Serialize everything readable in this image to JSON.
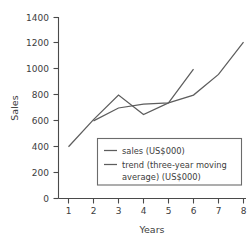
{
  "chart_data": {
    "type": "line",
    "title": "",
    "subtitle": "",
    "xlabel": "Years",
    "ylabel": "Sales",
    "x": [
      1,
      2,
      3,
      4,
      5,
      6,
      7,
      8
    ],
    "xtick_labels": [
      "1",
      "2",
      "3",
      "4",
      "5",
      "6",
      "7",
      "8"
    ],
    "ytick_labels": [
      "0",
      "200",
      "400",
      "600",
      "800",
      "1000",
      "1200",
      "1400"
    ],
    "ytick_values": [
      0,
      200,
      400,
      600,
      800,
      1000,
      1200,
      1400
    ],
    "xlim": [
      0.6,
      8.3
    ],
    "ylim": [
      0,
      1400
    ],
    "grid": false,
    "legend_position": "center-right-inside",
    "series": [
      {
        "name": "sales (US$000)",
        "x": [
          1,
          2,
          3,
          4,
          5,
          6,
          7,
          8
        ],
        "values": [
          400,
          610,
          800,
          650,
          740,
          800,
          960,
          1210
        ],
        "color": "#5d5d5d"
      },
      {
        "name": "trend (three-year moving average) (US$000)",
        "x": [
          2,
          3,
          4,
          5,
          6
        ],
        "values": [
          600,
          700,
          730,
          740,
          1000
        ],
        "color": "#5d5d5d"
      }
    ],
    "legend_entries": [
      {
        "label": "sales (US$000)",
        "lines": [
          "sales (US$000)"
        ],
        "color": "#5d5d5d"
      },
      {
        "label": "trend (three-year moving average) (US$000)",
        "lines": [
          "trend (three-year moving",
          "average) (US$000)"
        ],
        "color": "#5d5d5d"
      }
    ],
    "colors": {
      "axis": "#4a4a4a",
      "text": "#3d3d3d",
      "series": "#5d5d5d",
      "legend_border": "#6b6b6b",
      "background": "#ffffff"
    }
  }
}
